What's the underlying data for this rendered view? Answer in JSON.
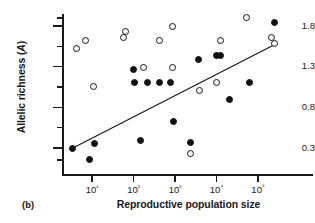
{
  "figure": {
    "panel_label": "(b)",
    "background": "#ffffff",
    "foreground": "#111111"
  },
  "chart_data": {
    "type": "scatter",
    "title": "",
    "xlabel": "Reproductive population size",
    "ylabel": "Allelic richness (A)",
    "xscale": "log10",
    "yscale": "linear",
    "xlim": [
      3,
      300000
    ],
    "ylim": [
      0.1,
      1.95
    ],
    "grid": false,
    "legend": null,
    "y_ticks": [
      0.3,
      0.8,
      1.3,
      1.8
    ],
    "y_tick_labels": [
      "0.3",
      "0.8",
      "1.3",
      "1.8"
    ],
    "y_minor_ticks": [
      0.15,
      0.55,
      1.05,
      1.55,
      1.9
    ],
    "x_ticks": [
      10,
      100,
      1000,
      10000,
      100000
    ],
    "x_tick_labels": [
      "10¹",
      "10²",
      "10³",
      "10⁴",
      "10⁵"
    ],
    "series": [
      {
        "name": "filled",
        "marker": "filled-circle",
        "color": "#111111",
        "points": [
          {
            "x": 3.3,
            "y": 0.3
          },
          {
            "x": 8.5,
            "y": 0.16
          },
          {
            "x": 11.5,
            "y": 0.35
          },
          {
            "x": 100,
            "y": 1.27
          },
          {
            "x": 108,
            "y": 1.1
          },
          {
            "x": 150,
            "y": 0.39
          },
          {
            "x": 215,
            "y": 1.1
          },
          {
            "x": 420,
            "y": 1.1
          },
          {
            "x": 800,
            "y": 1.1
          },
          {
            "x": 900,
            "y": 0.62
          },
          {
            "x": 2300,
            "y": 0.37
          },
          {
            "x": 3700,
            "y": 1.39
          },
          {
            "x": 9800,
            "y": 1.44
          },
          {
            "x": 12500,
            "y": 1.44
          },
          {
            "x": 21000,
            "y": 0.9
          },
          {
            "x": 62000,
            "y": 1.1
          },
          {
            "x": 250000,
            "y": 1.84
          }
        ]
      },
      {
        "name": "open",
        "marker": "open-circle",
        "color": "#111111",
        "points": [
          {
            "x": 4.2,
            "y": 1.53
          },
          {
            "x": 7.0,
            "y": 1.62
          },
          {
            "x": 11.0,
            "y": 1.06
          },
          {
            "x": 57,
            "y": 1.66
          },
          {
            "x": 63,
            "y": 1.73
          },
          {
            "x": 175,
            "y": 1.29
          },
          {
            "x": 420,
            "y": 1.62
          },
          {
            "x": 850,
            "y": 1.8
          },
          {
            "x": 880,
            "y": 1.29
          },
          {
            "x": 2400,
            "y": 0.23
          },
          {
            "x": 3900,
            "y": 1.01
          },
          {
            "x": 10000,
            "y": 1.1
          },
          {
            "x": 12500,
            "y": 1.62
          },
          {
            "x": 52000,
            "y": 1.9
          },
          {
            "x": 215000,
            "y": 1.66
          },
          {
            "x": 255000,
            "y": 1.58
          }
        ]
      }
    ],
    "fit_line": {
      "type": "linear-regression",
      "x_start": 3.3,
      "y_start": 0.3,
      "x_end": 255000,
      "y_end": 1.58
    }
  }
}
